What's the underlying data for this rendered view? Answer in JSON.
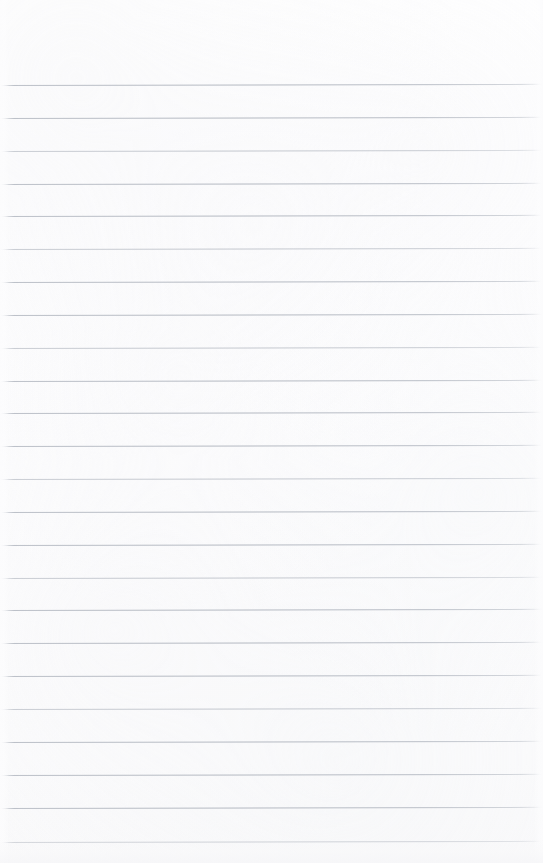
{
  "document": {
    "kind": "scanned-blank-ruled-page",
    "title": "Blank Ruled Notepad Page",
    "page_width": 543,
    "page_height": 863,
    "has_text_content": false,
    "has_handwriting": false,
    "has_margin_rule": false,
    "has_header": false,
    "has_page_number": false
  },
  "paper": {
    "background_color": "#fdfdfd",
    "edge_color": "#f7f7f8",
    "texture": "faint scan mottling"
  },
  "ruling": {
    "line_color": "#b9bec6",
    "line_thickness_px": 1,
    "line_count": 24,
    "first_line_y": 85,
    "last_line_y": 842,
    "line_spacing_px": 32.9,
    "line_start_x": 3,
    "line_end_x": 538,
    "tilt_degrees": -0.12,
    "top_margin_px": 85,
    "positions": [
      85,
      118,
      151,
      184,
      216,
      249,
      282,
      315,
      348,
      381,
      413,
      446,
      479,
      512,
      545,
      578,
      610,
      643,
      676,
      709,
      742,
      775,
      808,
      842
    ],
    "weights": [
      "heavy",
      "heavy",
      "light",
      "heavy",
      "heavy",
      "light",
      "heavy",
      "heavy",
      "light",
      "heavy",
      "heavy",
      "heavy",
      "light",
      "heavy",
      "heavy",
      "light",
      "heavy",
      "heavy",
      "heavy",
      "light",
      "heavy",
      "heavy",
      "heavy",
      "light"
    ]
  }
}
